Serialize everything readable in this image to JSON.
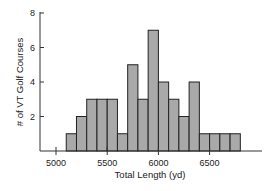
{
  "chart_data": {
    "type": "bar",
    "subtype": "histogram",
    "title": "",
    "xlabel": "Total Length (yd)",
    "ylabel": "# of VT Golf Courses",
    "bin_width": 100,
    "bins": [
      {
        "start": 5100,
        "end": 5200,
        "count": 1
      },
      {
        "start": 5200,
        "end": 5300,
        "count": 2
      },
      {
        "start": 5300,
        "end": 5400,
        "count": 3
      },
      {
        "start": 5400,
        "end": 5500,
        "count": 3
      },
      {
        "start": 5500,
        "end": 5600,
        "count": 3
      },
      {
        "start": 5600,
        "end": 5700,
        "count": 1
      },
      {
        "start": 5700,
        "end": 5800,
        "count": 5
      },
      {
        "start": 5800,
        "end": 5900,
        "count": 3
      },
      {
        "start": 5900,
        "end": 6000,
        "count": 7
      },
      {
        "start": 6000,
        "end": 6100,
        "count": 4
      },
      {
        "start": 6100,
        "end": 6200,
        "count": 3
      },
      {
        "start": 6200,
        "end": 6300,
        "count": 2
      },
      {
        "start": 6300,
        "end": 6400,
        "count": 4
      },
      {
        "start": 6400,
        "end": 6500,
        "count": 1
      },
      {
        "start": 6500,
        "end": 6600,
        "count": 1
      },
      {
        "start": 6600,
        "end": 6700,
        "count": 1
      },
      {
        "start": 6700,
        "end": 6800,
        "count": 1
      }
    ],
    "x_ticks": [
      5000,
      5500,
      6000,
      6500
    ],
    "y_ticks": [
      2,
      4,
      6,
      8
    ],
    "xlim": [
      4850,
      6950
    ],
    "ylim": [
      0,
      8
    ],
    "grid": false,
    "legend": null,
    "colors": {
      "bar_fill": "#a9a9a9",
      "bar_edge": "#222222",
      "axis": "#333333"
    }
  }
}
